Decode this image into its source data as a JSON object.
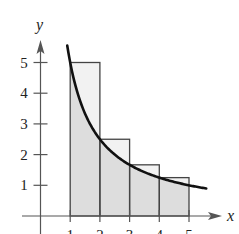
{
  "chart_data": {
    "type": "bar",
    "title": "",
    "xlabel": "x",
    "ylabel": "y",
    "x_ticks": [
      "1",
      "2",
      "3",
      "4",
      "5"
    ],
    "y_ticks": [
      "1",
      "2",
      "3",
      "4",
      "5"
    ],
    "xlim": [
      -0.85,
      6.2
    ],
    "ylim": [
      0,
      5.9
    ],
    "grid": false,
    "legend": null,
    "rectangles": [
      {
        "x_start": 1,
        "x_end": 2,
        "height": 5
      },
      {
        "x_start": 2,
        "x_end": 3,
        "height": 2.5
      },
      {
        "x_start": 3,
        "x_end": 4,
        "height": 1.667
      },
      {
        "x_start": 4,
        "x_end": 5,
        "height": 1.25
      }
    ],
    "curve": {
      "type": "line",
      "formula": "y = 5/x",
      "x_range": [
        0.9,
        5.6
      ]
    },
    "shaded_region": {
      "under": "curve",
      "x_range": [
        1,
        5
      ]
    }
  },
  "colors": {
    "axis": "#555555",
    "curve": "#111111",
    "rect_fill": "#f2f2f2",
    "shade_fill": "#dddddd",
    "rect_stroke": "#444444"
  }
}
